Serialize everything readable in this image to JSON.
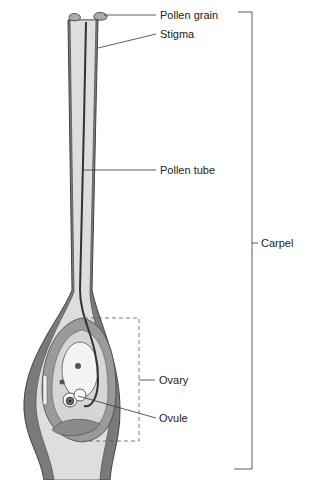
{
  "diagram": {
    "labels": {
      "pollen_grain": "Pollen grain",
      "stigma": "Stigma",
      "pollen_tube": "Pollen tube",
      "carpel": "Carpel",
      "ovary": "Ovary",
      "ovule": "Ovule"
    },
    "colors": {
      "dark_tissue": "#6e6e6e",
      "mid_tissue": "#9a9a9a",
      "light_tissue": "#d8d8d8",
      "pale": "#efefef",
      "line": "#333333"
    }
  }
}
